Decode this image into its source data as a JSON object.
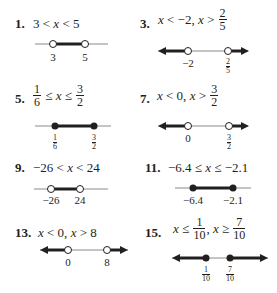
{
  "problems": [
    {
      "number": "1.",
      "expression": "3 < x < 5",
      "ticks": [
        "3",
        "5"
      ],
      "endpoints": [
        "open",
        "open"
      ],
      "shading": "between"
    },
    {
      "number": "3.",
      "expression_parts": [
        "x < −2, x > ",
        "2",
        "5"
      ],
      "ticks": [
        "−2"
      ],
      "tick_frac": [
        "2",
        "5"
      ],
      "endpoints": [
        "open",
        "open"
      ],
      "shading": "outside"
    },
    {
      "number": "5.",
      "expression_parts": [
        "1",
        "6",
        " ≤ x ≤ ",
        "3",
        "2"
      ],
      "tick_fracs": [
        [
          "1",
          "6"
        ],
        [
          "3",
          "2"
        ]
      ],
      "endpoints": [
        "closed",
        "closed"
      ],
      "shading": "between"
    },
    {
      "number": "7.",
      "expression_parts": [
        "x < 0, x > ",
        "3",
        "2"
      ],
      "ticks": [
        "0"
      ],
      "tick_frac": [
        "3",
        "2"
      ],
      "endpoints": [
        "open",
        "open"
      ],
      "shading": "outside"
    },
    {
      "number": "9.",
      "expression": "−26 < x < 24",
      "ticks": [
        "−26",
        "24"
      ],
      "endpoints": [
        "open",
        "open"
      ],
      "shading": "between"
    },
    {
      "number": "11.",
      "expression": "−6.4 ≤ x ≤ −2.1",
      "ticks": [
        "−6.4",
        "−2.1"
      ],
      "endpoints": [
        "closed",
        "closed"
      ],
      "shading": "between"
    },
    {
      "number": "13.",
      "expression": "x < 0, x > 8",
      "ticks": [
        "0",
        "8"
      ],
      "endpoints": [
        "open",
        "open"
      ],
      "shading": "outside"
    },
    {
      "number": "15.",
      "expression_parts": [
        "x ≤ ",
        "1",
        "10",
        ", x ≥ ",
        "7",
        "10"
      ],
      "tick_fracs": [
        [
          "1",
          "10"
        ],
        [
          "7",
          "10"
        ]
      ],
      "endpoints": [
        "closed",
        "closed"
      ],
      "shading": "outside"
    }
  ],
  "colors": {
    "ink": "#231f20",
    "line": "#8a8a8a"
  }
}
